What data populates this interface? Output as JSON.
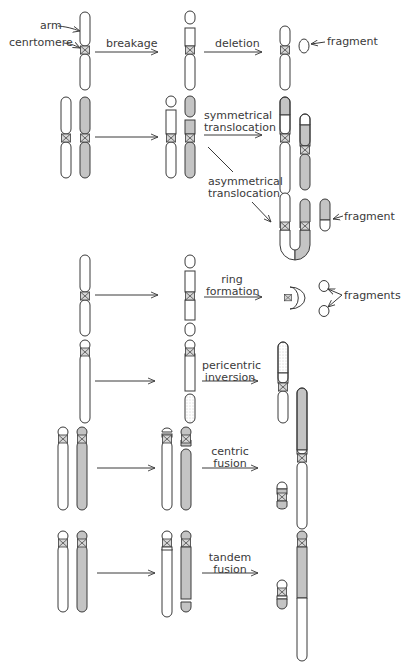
{
  "diagram": {
    "colors": {
      "outline": "#3a3a3a",
      "shaded": "#c4c4c4",
      "white": "#ffffff",
      "text": "#3a3a3a"
    },
    "labels": {
      "arm": "arm",
      "centromere": "cenrtomere",
      "breakage": "breakage",
      "deletion": "deletion",
      "fragment_deletion": "fragment",
      "symmetrical_1": "symmetrical",
      "symmetrical_2": "translocation",
      "asymmetrical_1": "asymmetrical",
      "asymmetrical_2": "translocation",
      "fragment_asym": "fragment",
      "ring_1": "ring",
      "ring_2": "formation",
      "fragments_ring": "fragments",
      "pericentric_1": "pericentric",
      "pericentric_2": "inversion",
      "centric_1": "centric",
      "centric_2": "fusion",
      "tandem_1": "tandem",
      "tandem_2": "fusion"
    },
    "rows": [
      {
        "name": "deletion",
        "steps": [
          "original chromosome",
          "breakage",
          "deleted chromosome + fragment"
        ]
      },
      {
        "name": "symmetrical translocation",
        "steps": [
          "two chromosomes",
          "breakage",
          "reciprocal exchange"
        ]
      },
      {
        "name": "asymmetrical translocation",
        "steps": [
          "dicentric chromosome",
          "acentric fragment"
        ]
      },
      {
        "name": "ring formation",
        "steps": [
          "original chromosome",
          "two breaks",
          "ring chromosome + 2 fragments"
        ]
      },
      {
        "name": "pericentric inversion",
        "steps": [
          "original chromosome",
          "breakage",
          "inverted segment"
        ]
      },
      {
        "name": "centric fusion",
        "steps": [
          "two acrocentric chromosomes",
          "breakage",
          "fused chromosome + small chromosome"
        ]
      },
      {
        "name": "tandem fusion",
        "steps": [
          "two acrocentric chromosomes",
          "breakage",
          "tandem fused chromosome + small chromosome"
        ]
      }
    ]
  }
}
